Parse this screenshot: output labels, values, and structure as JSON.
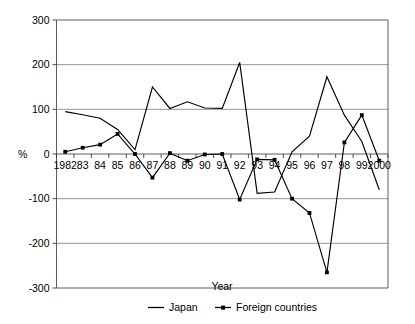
{
  "chart_data": {
    "type": "line",
    "title": "",
    "xlabel": "Year",
    "ylabel": "%",
    "ylim": [
      -300,
      300
    ],
    "yticks": [
      300,
      200,
      100,
      0,
      -100,
      -200,
      -300
    ],
    "ytick_labels": [
      "300",
      "200",
      "100",
      "0",
      "-100",
      "-200",
      "-300"
    ],
    "grid": true,
    "legend_position": "bottom",
    "categories": [
      1982,
      1983,
      1984,
      1985,
      1986,
      1987,
      1988,
      1989,
      1990,
      1991,
      1992,
      1993,
      1994,
      1995,
      1996,
      1997,
      1998,
      1999,
      2000
    ],
    "xtick_labels": [
      "1982",
      "83",
      "84",
      "85",
      "86",
      "87",
      "88",
      "89",
      "90",
      "91",
      "92",
      "93",
      "94",
      "95",
      "96",
      "97",
      "98",
      "99",
      "2000"
    ],
    "series": [
      {
        "name": "Japan",
        "marker": "none",
        "color": "#000000",
        "values": [
          95,
          88,
          80,
          55,
          10,
          150,
          102,
          117,
          103,
          102,
          205,
          -88,
          -85,
          5,
          40,
          173,
          87,
          28,
          -80
        ]
      },
      {
        "name": "Foreign countries",
        "marker": "square",
        "color": "#000000",
        "values": [
          5,
          14,
          21,
          45,
          0,
          -53,
          2,
          -15,
          -1,
          0,
          -102,
          -12,
          -13,
          -100,
          -132,
          -265,
          26,
          87,
          -15
        ]
      }
    ]
  },
  "axis": {
    "y_label": "%",
    "x_label": "Year"
  },
  "legend": {
    "items": [
      {
        "label": "Japan",
        "style": "line"
      },
      {
        "label": "Foreign countries",
        "style": "line-marker"
      }
    ]
  }
}
